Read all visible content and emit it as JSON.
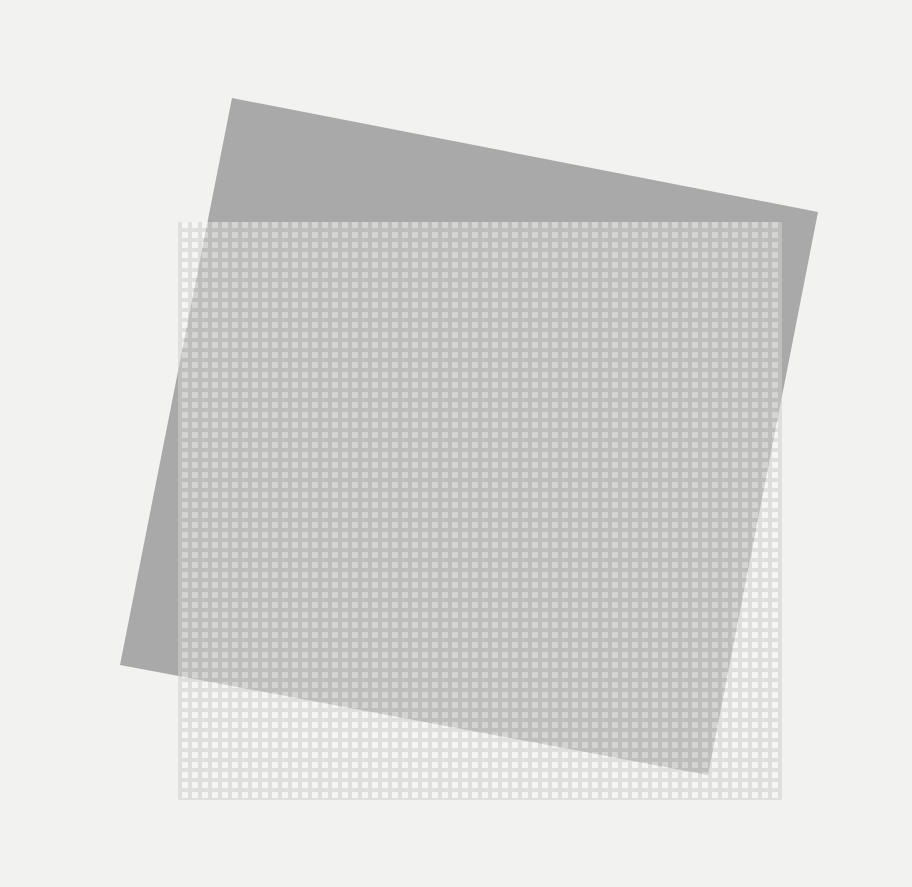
{
  "artwork": {
    "description": "Abstract composition: tilted gray square overlaid by a translucent white grid-patterned rectangle",
    "background_color": "#f2f2f0",
    "tilted_square": {
      "color": "#a9a9a9",
      "points": "232,98 818,212 708,775 120,665"
    },
    "grid_rectangle": {
      "x": 178,
      "y": 222,
      "width": 604,
      "height": 578,
      "cell": 10,
      "dot_size": 6,
      "dot_color": "#ffffff",
      "base_color": "#d4d4d2",
      "opacity": 0.55
    }
  }
}
